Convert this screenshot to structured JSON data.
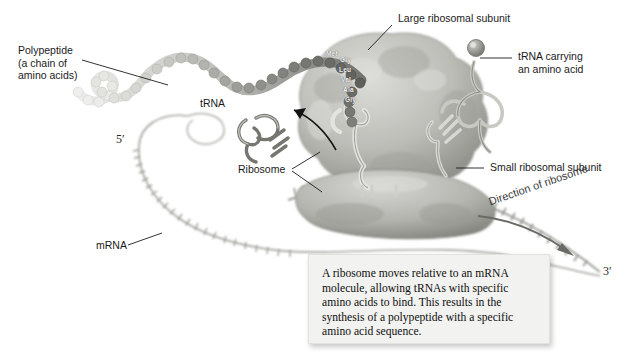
{
  "figure": {
    "background_color": "#ffffff"
  },
  "labels": {
    "polypeptide": "Polypeptide\n(a chain of\namino acids)",
    "trna": "tRNA",
    "ribosome": "Ribosome",
    "mrna": "mRNA",
    "large_subunit": "Large ribosomal subunit",
    "trna_carrying": "tRNA carrying\nan amino acid",
    "small_subunit": "Small ribosomal subunit",
    "direction": "Direction of ribosome",
    "five_prime": "5′",
    "three_prime": "3′"
  },
  "amino_acids": [
    {
      "name": "Met"
    },
    {
      "name": "Gly"
    },
    {
      "name": "Leu"
    },
    {
      "name": "Val"
    },
    {
      "name": "Ala"
    },
    {
      "name": "Gly"
    }
  ],
  "caption": {
    "text": "A ribosome moves relative to an mRNA molecule, allowing tRNAs with specific amino acids to bind. This results in the synthesis of a polypeptide with a specific amino acid sequence.",
    "background_color": "#f2f2f0"
  },
  "colors": {
    "ink": "#1a1a1a",
    "leader_line": "#2b2b2b",
    "ribosome_fill": "#b9b9b4",
    "ribosome_shadow": "#8f8f8a",
    "mrna_stroke": "#a9a9a4",
    "polypeptide_light": "#e2e2e0",
    "polypeptide_dark": "#6e6e6a"
  }
}
